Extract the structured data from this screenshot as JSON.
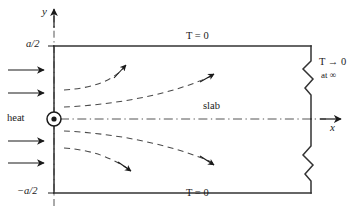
{
  "figure": {
    "type": "technical-diagram",
    "colors": {
      "ink": "#1a1a1a",
      "background": "#ffffff",
      "slab_outline": "#333333",
      "dashed_flux": "#555555"
    }
  },
  "axes": {
    "y_label": "y",
    "x_label": "x",
    "y_axis_note": "vertical dash-dot axis through x = 0",
    "x_axis_note": "horizontal dash-dot centerline at y = 0"
  },
  "labels": {
    "top_half_width": "a/2",
    "bottom_half_width": "−a/2",
    "heat": "heat",
    "slab": "slab",
    "top_boundary": "T = 0",
    "bottom_boundary": "T = 0",
    "far_field": "T → 0",
    "far_field_condition": "at ∞"
  },
  "geometry": {
    "slab_left_x": 54,
    "slab_right_x": 311,
    "slab_top_y": 46,
    "slab_bottom_y": 193,
    "centerline_y": 119,
    "source_x": 54,
    "source_y": 119,
    "source_radius": 7
  },
  "heat_arrows": {
    "count": 4,
    "y_positions": [
      70,
      93,
      141,
      163
    ],
    "x_start": 8,
    "x_end": 44
  },
  "flux_curves": {
    "count": 5,
    "description": "dashed streamlines emanating from the line source"
  }
}
